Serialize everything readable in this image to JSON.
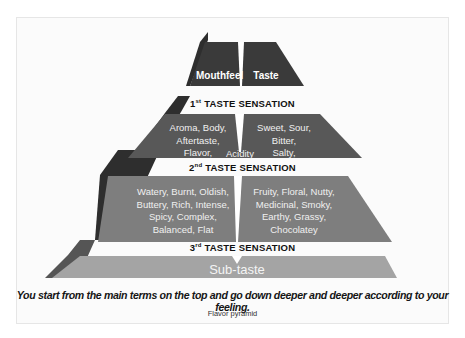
{
  "figure": {
    "caption": "Flavor pyramid",
    "description": "You start from the main terms on the top and go down deeper and deeper according to your feeling."
  },
  "pyramid": {
    "colors": {
      "tier1": "#3a3a3a",
      "tier2": "#5a5a5a",
      "tier3": "#808080",
      "tier4": "#a6a6a6",
      "side_shadow": "#2e2e2e",
      "band": "#ffffff"
    },
    "tier1": {
      "left": "Mouthfeel",
      "right": "Taste"
    },
    "sensation1": {
      "ordinal": "1",
      "suffix": "st",
      "label": "TASTE SENSATION"
    },
    "tier2": {
      "left": [
        "Aroma, Body,",
        "Aftertaste,",
        "Flavor,"
      ],
      "center": "Acidity",
      "right": [
        "Sweet, Sour,",
        "Bitter,",
        "Salty,"
      ]
    },
    "sensation2": {
      "ordinal": "2",
      "suffix": "nd",
      "label": "TASTE SENSATION"
    },
    "tier3": {
      "left": [
        "Watery, Burnt, Oldish,",
        "Buttery, Rich, Intense,",
        "Spicy, Complex,",
        "Balanced, Flat"
      ],
      "right": [
        "Fruity, Floral, Nutty,",
        "Medicinal, Smoky,",
        "Earthy, Grassy,",
        "Chocolatey"
      ]
    },
    "sensation3": {
      "ordinal": "3",
      "suffix": "rd",
      "label": "TASTE SENSATION"
    },
    "tier4": {
      "label": "Sub-taste"
    }
  }
}
